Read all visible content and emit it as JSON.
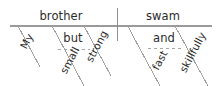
{
  "diagram": {
    "type": "reed-kellogg-sentence-diagram",
    "sentence": "My brother, small but strong, swam fast and skillfully.",
    "colors": {
      "background": "#ffffff",
      "line": "#9a9a9a",
      "text": "#2b2b2b",
      "dashed_line": "#a6a6a6"
    },
    "baseline": {
      "label": "baseline",
      "x1": 10,
      "y1": 26,
      "x2": 212,
      "y2": 26
    },
    "divider": {
      "label": "subject-predicate-divider",
      "x": 117,
      "y1": 8,
      "y2": 41
    },
    "subject": {
      "word": "brother",
      "x": 61,
      "y": 20
    },
    "verb": {
      "word": "swam",
      "x": 163,
      "y": 20
    },
    "modifiers": [
      {
        "word": "My",
        "role": "possessive-adjective",
        "modifies": "brother",
        "x": 30,
        "y": 43,
        "rotation": -62
      },
      {
        "word": "small",
        "role": "adjective",
        "modifies": "brother",
        "x": 73,
        "y": 62,
        "rotation": -62
      },
      {
        "word": "strong",
        "role": "adjective",
        "modifies": "brother",
        "x": 100,
        "y": 48,
        "rotation": -62
      },
      {
        "word": "fast",
        "role": "adverb",
        "modifies": "swam",
        "x": 163,
        "y": 62,
        "rotation": -62
      },
      {
        "word": "skillfully",
        "role": "adverb",
        "modifies": "swam",
        "x": 196,
        "y": 54,
        "rotation": -62
      }
    ],
    "conjunctions": [
      {
        "word": "but",
        "joins": [
          "small",
          "strong"
        ],
        "x": 73,
        "y": 42,
        "dash_x1": 58,
        "dash_y1": 49,
        "dash_x2": 90,
        "dash_y2": 49
      },
      {
        "word": "and",
        "joins": [
          "fast",
          "skillfully"
        ],
        "x": 164,
        "y": 42,
        "dash_x1": 148,
        "dash_y1": 48,
        "dash_x2": 181,
        "dash_y2": 48
      }
    ],
    "slant_lines": [
      {
        "name": "slant-my",
        "x1": 18,
        "y1": 26,
        "x2": 40,
        "y2": 67
      },
      {
        "name": "slant-small-top",
        "x1": 52,
        "y1": 26,
        "x2": 58,
        "y2": 37
      },
      {
        "name": "slant-small",
        "x1": 58,
        "y1": 37,
        "x2": 84,
        "y2": 86
      },
      {
        "name": "slant-strong",
        "x1": 84,
        "y1": 26,
        "x2": 111,
        "y2": 76
      },
      {
        "name": "slant-fast-top",
        "x1": 128,
        "y1": 26,
        "x2": 133,
        "y2": 36
      },
      {
        "name": "slant-fast",
        "x1": 133,
        "y1": 36,
        "x2": 160,
        "y2": 86
      },
      {
        "name": "slant-skillfully",
        "x1": 175,
        "y1": 26,
        "x2": 208,
        "y2": 86
      }
    ]
  }
}
